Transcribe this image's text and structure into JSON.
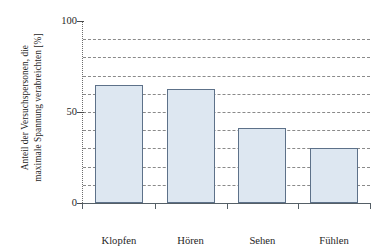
{
  "chart_data": {
    "type": "bar",
    "title": "",
    "subtitle": "",
    "xlabel": "",
    "ylabel": "Anteil der Versuchspersonen, die maximale Spannung verabreichten [%]",
    "ylabel_lines": [
      "Anteil der Versuchspersonen, die",
      "maximale Spannung verabreichten [%]"
    ],
    "categories": [
      "Klopfen",
      "Hören",
      "Sehen",
      "Fühlen"
    ],
    "values": [
      65,
      62.5,
      41,
      30
    ],
    "series": [
      {
        "name": "Anteil der Versuchspersonen",
        "values": [
          65,
          62.5,
          41,
          30
        ]
      }
    ],
    "ylim": [
      0,
      100
    ],
    "xlim": [
      0,
      4
    ],
    "ytick_labels": [
      "0",
      "50",
      "100"
    ],
    "ytick_values": [
      0,
      50,
      100
    ],
    "gridline_values": [
      10,
      20,
      30,
      40,
      50,
      60,
      70,
      80,
      90
    ],
    "grid": true,
    "grid_axis": "y",
    "grid_style": "dashed",
    "legend": false,
    "legend_position": "none",
    "annotations": [],
    "colors": {
      "bar_fill": "#dde7f1",
      "bar_border": "#5d7189",
      "gridline": "#8a8a8a",
      "axis": "#555f66",
      "text": "#262626",
      "background": "#ffffff"
    }
  }
}
